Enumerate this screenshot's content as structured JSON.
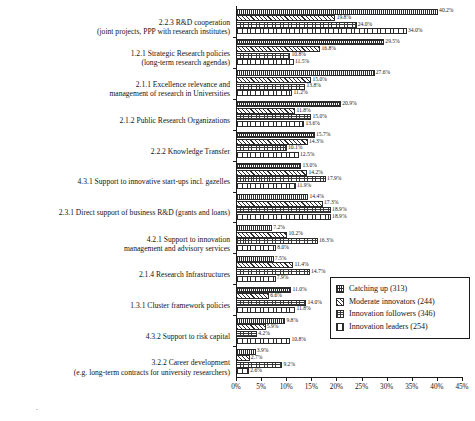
{
  "chart_data": {
    "type": "bar",
    "orientation": "horizontal",
    "title": "",
    "xlabel": "",
    "ylabel": "",
    "xlim": [
      0,
      45
    ],
    "xticks": [
      "0%",
      "5%",
      "10%",
      "15%",
      "20%",
      "25%",
      "30%",
      "35%",
      "40%",
      "45%"
    ],
    "xtick_values": [
      0,
      5,
      10,
      15,
      20,
      25,
      30,
      35,
      40,
      45
    ],
    "grid": false,
    "legend_position": "bottom-right",
    "value_suffix": "%",
    "categories": [
      "2.2.3 R&D cooperation\n(joint projects, PPP with research institutes)",
      "1.2.1 Strategic Research policies\n(long-term research agendas)",
      "2.1.1 Excellence relevance and\nmanagement of research in Universities",
      "2.1.2 Public Research Organizations",
      "2.2.2 Knowledge Transfer",
      "4.3.1 Support to innovative start-ups incl. gazelles",
      "2.3.1 Direct support of business R&D (grants and loans)",
      "4.2.1 Support to innovation\nmanagement and advisory services",
      "2.1.4 Research Infrastructures",
      "1.3.1 Cluster framework policies",
      "4.3.2 Support to risk capital",
      "3.2.2 Career development\n(e.g. long-term contracts for university researchers)"
    ],
    "series": [
      {
        "name": "Catching up (313)",
        "pattern": "dense-grid",
        "values": [
          40.2,
          29.5,
          27.6,
          20.9,
          15.7,
          13.0,
          14.4,
          7.2,
          7.5,
          11.0,
          9.8,
          3.9
        ]
      },
      {
        "name": "Moderate innovators (244)",
        "pattern": "diagonal-hatch",
        "values": [
          19.8,
          16.8,
          15.0,
          11.8,
          14.3,
          14.2,
          17.3,
          10.2,
          11.4,
          6.6,
          5.9,
          2.7
        ]
      },
      {
        "name": "Innovation followers (346)",
        "pattern": "fine-dots",
        "values": [
          24.0,
          10.8,
          13.8,
          15.0,
          10.1,
          17.9,
          18.9,
          16.3,
          14.7,
          14.0,
          4.2,
          9.2
        ]
      },
      {
        "name": "Innovation leaders (254)",
        "pattern": "vertical-stripes",
        "values": [
          34.0,
          11.5,
          11.2,
          13.6,
          12.5,
          11.9,
          18.9,
          8.0,
          7.9,
          11.8,
          10.8,
          2.6
        ]
      }
    ],
    "bar_value_labels": [
      [
        "40.2%",
        "19.8%",
        "24.0%",
        "34.0%"
      ],
      [
        "29.5%",
        "16.8%",
        "10.8%",
        "11.5%"
      ],
      [
        "27.6%",
        "15.0%",
        "13.8%",
        "11.2%"
      ],
      [
        "20.9%",
        "11.8%",
        "15.0%",
        "13.6%"
      ],
      [
        "15.7%",
        "14.3%",
        "10.1%",
        "12.5%"
      ],
      [
        "13.0%",
        "14.2%",
        "17.9%",
        "11.9%"
      ],
      [
        "14.4%",
        "17.3%",
        "18.9%",
        "18.9%"
      ],
      [
        "7.2%",
        "10.2%",
        "16.3%",
        "8.0%"
      ],
      [
        "7.5%",
        "11.4%",
        "14.7%",
        "7.9%"
      ],
      [
        "11.0%",
        "6.6%",
        "14.0%",
        "11.8%"
      ],
      [
        "9.8%",
        "5.9%",
        "4.2%",
        "10.8%"
      ],
      [
        "3.9%",
        "2.7%",
        "9.2%",
        "2.6%"
      ]
    ]
  },
  "legend": {
    "entries": [
      "Catching up (313)",
      "Moderate innovators (244)",
      "Innovation followers (346)",
      "Innovation leaders (254)"
    ]
  }
}
